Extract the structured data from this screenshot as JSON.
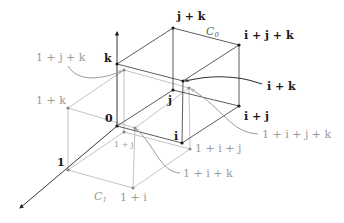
{
  "diagram": {
    "title": "",
    "colors": {
      "cube0": "#333333",
      "cube1": "#b4b4b4",
      "label_black": "#1a1a1a",
      "label_gray": "#9a9a9a"
    },
    "cube_labels": {
      "c0": "C",
      "c0_sub": "0",
      "c1": "C",
      "c1_sub": "1"
    },
    "axes": {
      "vertical": "k-axis (up)",
      "diagonal": "1-axis (down-left)"
    },
    "black_vertices": {
      "zero": "0",
      "i": "i",
      "j": "j",
      "k": "k",
      "i_plus_j": "i + j",
      "j_plus_k": "j + k",
      "i_plus_k": "i + k",
      "i_plus_j_plus_k": "i + j + k"
    },
    "gray_vertices": {
      "one": "1",
      "one_plus_i": "1 + i",
      "one_plus_j": "1 + j",
      "one_plus_k": "1 + k",
      "one_plus_i_plus_j": "1 + i + j",
      "one_plus_j_plus_k": "1 + j + k",
      "one_plus_i_plus_k": "1 + i + k",
      "one_plus_i_plus_j_plus_k": "1 + i + j + k"
    }
  }
}
